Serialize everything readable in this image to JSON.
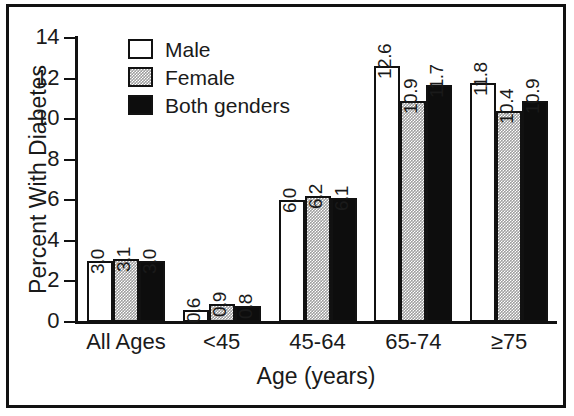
{
  "chart_data": {
    "type": "bar",
    "title": "",
    "subtitle": "",
    "xlabel": "Age (years)",
    "ylabel": "Percent With Diabetes",
    "categories": [
      "All Ages",
      "<45",
      "45-64",
      "65-74",
      "≥75"
    ],
    "series": [
      {
        "name": "Male",
        "values": [
          3.0,
          0.6,
          6.0,
          12.6,
          11.8
        ],
        "color": "#ffffff",
        "swatch": "white-open"
      },
      {
        "name": "Female",
        "values": [
          3.1,
          0.9,
          6.2,
          10.9,
          10.4
        ],
        "color": "#9e9e9e",
        "swatch": "gray-stipple"
      },
      {
        "name": "Both genders",
        "values": [
          3.0,
          0.8,
          6.1,
          11.7,
          10.9
        ],
        "color": "#0d0d0d",
        "swatch": "black-solid"
      }
    ],
    "ylim": [
      0,
      14
    ],
    "yticks": [
      0,
      2,
      4,
      6,
      8,
      10,
      12,
      14
    ],
    "ytick_labels": [
      "0",
      "2",
      "4",
      "6",
      "8",
      "10",
      "12",
      "14"
    ],
    "grid": false,
    "legend_position": "top-left-inside",
    "value_labels": true,
    "value_label_rotation": 90,
    "value_label_format": "one-decimal",
    "frame": "outer-box-border"
  },
  "axis": {
    "y_title": "Percent With Diabetes",
    "x_title": "Age (years)"
  },
  "legend": {
    "items": [
      {
        "label": "Male"
      },
      {
        "label": "Female"
      },
      {
        "label": "Both genders"
      }
    ]
  }
}
